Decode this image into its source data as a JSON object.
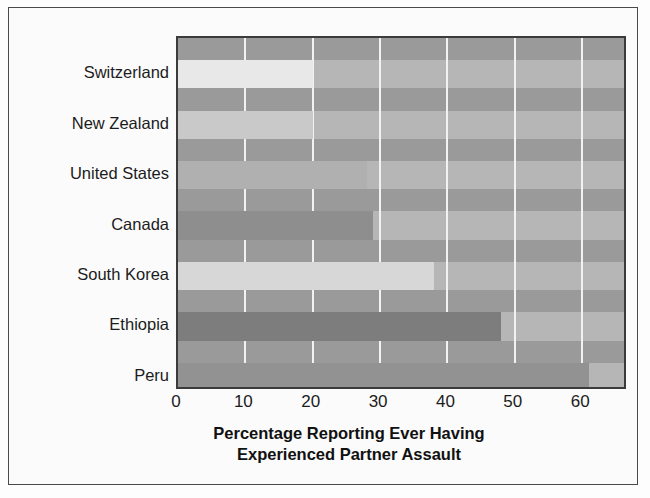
{
  "chart_data": {
    "type": "bar",
    "orientation": "horizontal",
    "title": "",
    "xlabel": "Percentage Reporting Ever Having Experienced Partner Assault",
    "xlabel_line1": "Percentage Reporting Ever Having",
    "xlabel_line2": "Experienced Partner Assault",
    "ylabel": "",
    "categories": [
      "Switzerland",
      "New Zealand",
      "United States",
      "Canada",
      "South Korea",
      "Ethiopia",
      "Peru"
    ],
    "values": [
      20,
      20,
      28,
      29,
      38,
      48,
      61
    ],
    "xlim": [
      0,
      66.8
    ],
    "xticks": [
      0,
      10,
      20,
      30,
      40,
      50,
      60
    ],
    "xtick_labels": [
      "0",
      "10",
      "20",
      "30",
      "40",
      "50",
      "60"
    ],
    "grid": "vertical-white-gridlines",
    "legend": "none",
    "bar_colors": [
      "#e8e8e8",
      "#c9c9c9",
      "#b0b0b0",
      "#8e8e8e",
      "#d7d7d7",
      "#7d7d7d",
      "#929292"
    ],
    "plot_background": "#b2b2b2",
    "band_color": "#9a9a9a",
    "gridline_color": "#f2f2f2",
    "frame_color": "#3b3b3b",
    "text_color": "#1c1c1c"
  },
  "figure": {
    "background": "#fbfbfb",
    "border_color": "#4a4a4a"
  }
}
